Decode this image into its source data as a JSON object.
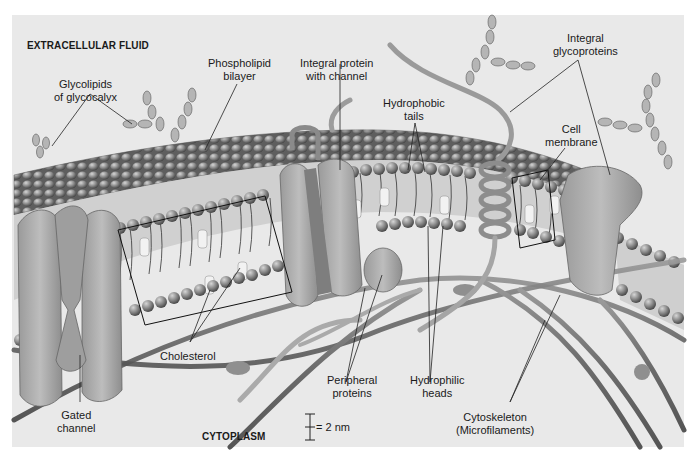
{
  "figure": {
    "regions": {
      "top": "EXTRACELLULAR FLUID",
      "bottom": "CYTOPLASM"
    },
    "labels": {
      "glycolipids": [
        "Glycolipids",
        "of glycocalyx"
      ],
      "phospholipid_bilayer": [
        "Phospholipid",
        "bilayer"
      ],
      "integral_protein_channel": [
        "Integral protein",
        "with channel"
      ],
      "hydrophobic_tails": [
        "Hydrophobic",
        "tails"
      ],
      "integral_glycoproteins": [
        "Integral",
        "glycoproteins"
      ],
      "cell_membrane": [
        "Cell",
        "membrane"
      ],
      "cholesterol": [
        "Cholesterol"
      ],
      "gated_channel": [
        "Gated",
        "channel"
      ],
      "peripheral_proteins": [
        "Peripheral",
        "proteins"
      ],
      "hydrophilic_heads": [
        "Hydrophilic",
        "heads"
      ],
      "cytoskeleton": [
        "Cytoskeleton",
        "(Microfilaments)"
      ]
    },
    "scale_bar": {
      "label": "= 2 nm"
    },
    "colors": {
      "panel_bg": "#e9e9e9",
      "head": "#8d8d8d",
      "protein": "#a9a9a9",
      "filament": "#7a7a7a",
      "sugar": "#b5b5b5",
      "label_text": "#1a1a1a",
      "leader_line": "#222222"
    }
  }
}
